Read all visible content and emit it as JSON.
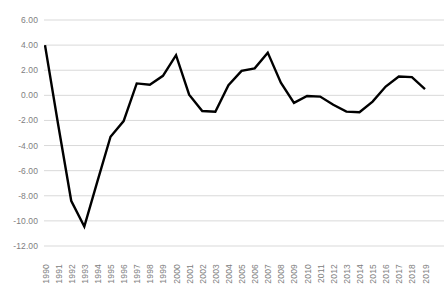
{
  "chart_data": {
    "type": "line",
    "title": "",
    "xlabel": "",
    "ylabel": "",
    "x": [
      1990,
      1991,
      1992,
      1993,
      1994,
      1995,
      1996,
      1997,
      1998,
      1999,
      2000,
      2001,
      2002,
      2003,
      2004,
      2005,
      2006,
      2007,
      2008,
      2009,
      2010,
      2011,
      2012,
      2013,
      2014,
      2015,
      2016,
      2017,
      2018,
      2019
    ],
    "categories": [
      "1990",
      "1991",
      "1992",
      "1993",
      "1994",
      "1995",
      "1996",
      "1997",
      "1998",
      "1999",
      "2000",
      "2001",
      "2002",
      "2003",
      "2004",
      "2005",
      "2006",
      "2007",
      "2008",
      "2009",
      "2010",
      "2011",
      "2012",
      "2013",
      "2014",
      "2015",
      "2016",
      "2017",
      "2018",
      "2019"
    ],
    "values": [
      4.0,
      -2.3,
      -8.4,
      -10.45,
      -6.85,
      -3.3,
      -2.05,
      0.95,
      0.85,
      1.55,
      3.2,
      0.05,
      -1.25,
      -1.3,
      0.8,
      1.95,
      2.15,
      3.4,
      1.0,
      -0.6,
      -0.05,
      -0.1,
      -0.75,
      -1.3,
      -1.35,
      -0.5,
      0.7,
      1.5,
      1.45,
      0.5
    ],
    "series": [
      {
        "name": "series-1",
        "values": [
          4.0,
          -2.3,
          -8.4,
          -10.45,
          -6.85,
          -3.3,
          -2.05,
          0.95,
          0.85,
          1.55,
          3.2,
          0.05,
          -1.25,
          -1.3,
          0.8,
          1.95,
          2.15,
          3.4,
          1.0,
          -0.6,
          -0.05,
          -0.1,
          -0.75,
          -1.3,
          -1.35,
          -0.5,
          0.7,
          1.5,
          1.45,
          0.5
        ],
        "color": "#000000"
      }
    ],
    "ylim": [
      -12.0,
      6.0
    ],
    "ytick_labels": [
      "6.00",
      "4.00",
      "2.00",
      "0.00",
      "-2.00",
      "-4.00",
      "-6.00",
      "-8.00",
      "-10.00",
      "-12.00"
    ],
    "ytick_values": [
      6.0,
      4.0,
      2.0,
      0.0,
      -2.0,
      -4.0,
      -6.0,
      -8.0,
      -10.0,
      -12.0
    ],
    "grid": true,
    "grid_color": "#d9d9d9",
    "axis_label_color": "#808080",
    "legend": false,
    "legend_position": "none",
    "line_color": "#000000",
    "line_width": 2.4,
    "background_color": "#ffffff"
  }
}
